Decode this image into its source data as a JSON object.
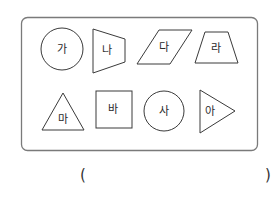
{
  "shapes": [
    {
      "label": "가",
      "type": "circle"
    },
    {
      "label": "나",
      "type": "trapezoid"
    },
    {
      "label": "다",
      "type": "parallelogram"
    },
    {
      "label": "라",
      "type": "trapezoid"
    },
    {
      "label": "마",
      "type": "triangle"
    },
    {
      "label": "바",
      "type": "square"
    },
    {
      "label": "사",
      "type": "circle"
    },
    {
      "label": "아",
      "type": "triangle"
    }
  ],
  "answer": {
    "open": "(",
    "close": ")",
    "value": ""
  }
}
